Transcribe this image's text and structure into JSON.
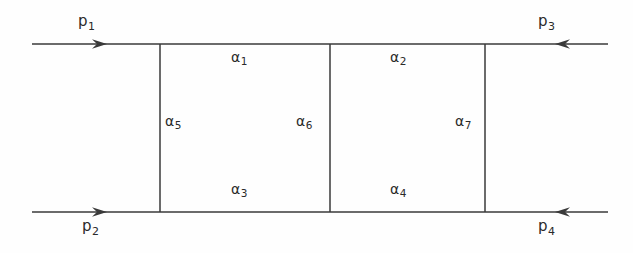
{
  "figure": {
    "background_color": "#fefefe",
    "line_color": "#3a3a3a",
    "text_color": "#2a2a2a"
  },
  "external_momenta": [
    {
      "id": "p1",
      "base": "p",
      "sub": "1",
      "x": 78,
      "y": 14,
      "direction": "right",
      "side": "top-left"
    },
    {
      "id": "p3",
      "base": "p",
      "sub": "3",
      "x": 538,
      "y": 14,
      "direction": "left",
      "side": "top-right"
    },
    {
      "id": "p2",
      "base": "p",
      "sub": "2",
      "x": 82,
      "y": 219,
      "direction": "right",
      "side": "bottom-left"
    },
    {
      "id": "p4",
      "base": "p",
      "sub": "4",
      "x": 538,
      "y": 219,
      "direction": "left",
      "side": "bottom-right"
    }
  ],
  "internal_indices": [
    {
      "id": "a1",
      "base": "α",
      "sub": "1",
      "x": 231,
      "y": 50,
      "edge": "top-left-rung"
    },
    {
      "id": "a2",
      "base": "α",
      "sub": "2",
      "x": 390,
      "y": 50,
      "edge": "top-right-rung"
    },
    {
      "id": "a3",
      "base": "α",
      "sub": "3",
      "x": 231,
      "y": 182,
      "edge": "bottom-left-rung"
    },
    {
      "id": "a4",
      "base": "α",
      "sub": "4",
      "x": 390,
      "y": 182,
      "edge": "bottom-right-rung"
    },
    {
      "id": "a5",
      "base": "α",
      "sub": "5",
      "x": 165,
      "y": 114,
      "edge": "left-vertical"
    },
    {
      "id": "a6",
      "base": "α",
      "sub": "6",
      "x": 296,
      "y": 114,
      "edge": "middle-vertical"
    },
    {
      "id": "a7",
      "base": "α",
      "sub": "7",
      "x": 455,
      "y": 114,
      "edge": "right-vertical"
    }
  ],
  "geometry": {
    "top_rail_y": 44,
    "bottom_rail_y": 212,
    "left_end_x": 32,
    "right_end_x": 608,
    "vertical_x": [
      160,
      330,
      485
    ],
    "arrow_top_left_x": 106,
    "arrow_top_right_x": 556,
    "arrow_bottom_left_x": 106,
    "arrow_bottom_right_x": 556
  }
}
